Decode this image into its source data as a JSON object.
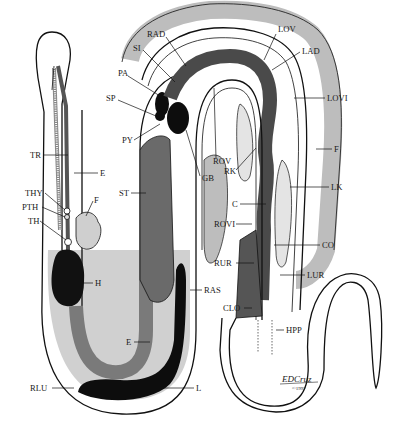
{
  "figure": {
    "signature": "EDCruz",
    "copyright": "©1997"
  },
  "colors": {
    "background": "#ffffff",
    "outline": "#111111",
    "light_gray": "#c8c8c8",
    "medium_gray": "#8c8c8c",
    "dark_gray": "#5a5a5a",
    "black": "#0d0d0d"
  },
  "labels": [
    {
      "id": "TR",
      "text": "TR",
      "x": 30,
      "y": 158
    },
    {
      "id": "E_upper",
      "text": "E",
      "x": 100,
      "y": 176
    },
    {
      "id": "THY",
      "text": "THY",
      "x": 25,
      "y": 196
    },
    {
      "id": "F_left",
      "text": "F",
      "x": 94,
      "y": 203
    },
    {
      "id": "PTH",
      "text": "PTH",
      "x": 22,
      "y": 210
    },
    {
      "id": "TH",
      "text": "TH",
      "x": 28,
      "y": 224
    },
    {
      "id": "H",
      "text": "H",
      "x": 95,
      "y": 286
    },
    {
      "id": "E_lower",
      "text": "E",
      "x": 126,
      "y": 345
    },
    {
      "id": "RLU",
      "text": "RLU",
      "x": 30,
      "y": 391
    },
    {
      "id": "L",
      "text": "L",
      "x": 196,
      "y": 391
    },
    {
      "id": "RAS",
      "text": "RAS",
      "x": 204,
      "y": 293
    },
    {
      "id": "RAD",
      "text": "RAD",
      "x": 147,
      "y": 37
    },
    {
      "id": "SI",
      "text": "SI",
      "x": 133,
      "y": 51
    },
    {
      "id": "PA",
      "text": "PA",
      "x": 118,
      "y": 76
    },
    {
      "id": "SP",
      "text": "SP",
      "x": 106,
      "y": 101
    },
    {
      "id": "PY",
      "text": "PY",
      "x": 122,
      "y": 143
    },
    {
      "id": "ST",
      "text": "ST",
      "x": 119,
      "y": 196
    },
    {
      "id": "GB",
      "text": "GB",
      "x": 202,
      "y": 181
    },
    {
      "id": "ROV",
      "text": "ROV",
      "x": 213,
      "y": 164
    },
    {
      "id": "RK",
      "text": "RK",
      "x": 224,
      "y": 174
    },
    {
      "id": "LOV",
      "text": "LOV",
      "x": 278,
      "y": 32
    },
    {
      "id": "LAD",
      "text": "LAD",
      "x": 302,
      "y": 54
    },
    {
      "id": "LOVI",
      "text": "LOVI",
      "x": 327,
      "y": 101
    },
    {
      "id": "F_right",
      "text": "F",
      "x": 334,
      "y": 152
    },
    {
      "id": "LK",
      "text": "LK",
      "x": 331,
      "y": 190
    },
    {
      "id": "C",
      "text": "C",
      "x": 232,
      "y": 207
    },
    {
      "id": "ROVI",
      "text": "ROVI",
      "x": 214,
      "y": 227
    },
    {
      "id": "CO",
      "text": "CO",
      "x": 322,
      "y": 248
    },
    {
      "id": "RUR",
      "text": "RUR",
      "x": 214,
      "y": 266
    },
    {
      "id": "LUR",
      "text": "LUR",
      "x": 307,
      "y": 278
    },
    {
      "id": "CLO",
      "text": "CLO",
      "x": 223,
      "y": 311
    },
    {
      "id": "HPP",
      "text": "HPP",
      "x": 286,
      "y": 333
    }
  ]
}
